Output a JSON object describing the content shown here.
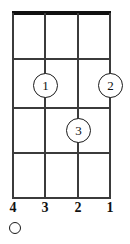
{
  "diagram": {
    "kind": "chord-diagram",
    "instrument_strings": 4,
    "fret_count": 4,
    "nut_shown": true,
    "colors": {
      "line": "#3b3b3b",
      "nut": "#111111",
      "text": "#111111",
      "background": "#ffffff"
    },
    "geometry": {
      "left": 12,
      "right": 111,
      "top": 13,
      "bottom": 198,
      "string_x": [
        13,
        45,
        78,
        110
      ],
      "fret_y": [
        13,
        59,
        108,
        153,
        198
      ]
    },
    "strings": [
      {
        "number_label": "4",
        "x": 13,
        "state": "open",
        "marker": "open-circle"
      },
      {
        "number_label": "3",
        "x": 45,
        "state": "fretted",
        "marker": "none"
      },
      {
        "number_label": "2",
        "x": 78,
        "state": "fretted",
        "marker": "none"
      },
      {
        "number_label": "1",
        "x": 110,
        "state": "fretted",
        "marker": "none"
      }
    ],
    "fingerings": [
      {
        "finger_label": "1",
        "string_number": 3,
        "fret": 2,
        "x": 45,
        "y": 85
      },
      {
        "finger_label": "2",
        "string_number": 1,
        "fret": 2,
        "x": 110,
        "y": 85
      },
      {
        "finger_label": "3",
        "string_number": 2,
        "fret": 3,
        "x": 78,
        "y": 130
      }
    ]
  }
}
